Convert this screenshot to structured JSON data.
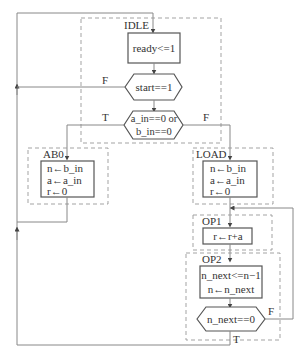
{
  "diagram": {
    "type": "ASM flowchart",
    "states": {
      "idle": {
        "label": "IDLE",
        "actions": [
          "ready<=1"
        ],
        "decisions": [
          {
            "condition": "start==1",
            "false_label": "F"
          },
          {
            "condition_line1": "a_in==0 or",
            "condition_line2": "b_in==0",
            "true_label": "T",
            "false_label": "F"
          }
        ]
      },
      "ab0": {
        "label": "AB0",
        "actions": [
          "n←b_in",
          "a←a_in",
          "r←0"
        ]
      },
      "load": {
        "label": "LOAD",
        "actions": [
          "n←b_in",
          "a←a_in",
          "r←0"
        ]
      },
      "op1": {
        "label": "OP1",
        "actions": [
          "r←r+a"
        ]
      },
      "op2": {
        "label": "OP2",
        "actions": [
          "n_next<=n−1",
          "n←n_next"
        ],
        "decision": {
          "condition": "n_next==0",
          "true_label": "T",
          "false_label": "F"
        }
      }
    }
  }
}
